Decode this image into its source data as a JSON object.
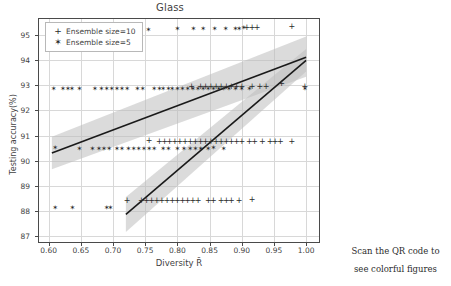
{
  "figure": {
    "title": "Glass",
    "xlabel": "Diversity R̄",
    "ylabel": "Testing accuracy(%)"
  },
  "legend": {
    "position": "upper-left",
    "entries": [
      {
        "marker": "+",
        "label": "Ensemble size=10"
      },
      {
        "marker": "✶",
        "label": "Ensemble size=5"
      }
    ]
  },
  "qr": {
    "caption_line1": "Scan the QR code to",
    "caption_line2": "see colorful figures",
    "icon": "qr-code-icon"
  },
  "colors": {
    "marker": "#2b2b2b",
    "regression_line": "#1a1a1a",
    "confidence_band": "#bdbdbd",
    "grid": "#d8d8d8",
    "axis": "#4a4a4a",
    "background": "#ffffff"
  },
  "chart_data": {
    "type": "scatter",
    "title": "Glass",
    "xlabel": "Diversity R̄",
    "ylabel": "Testing accuracy(%)",
    "xlim": [
      0.585,
      1.02
    ],
    "ylim": [
      86.75,
      95.65
    ],
    "xticks": [
      0.6,
      0.65,
      0.7,
      0.75,
      0.8,
      0.85,
      0.9,
      0.95,
      1.0
    ],
    "xticklabels": [
      "0.60",
      "0.65",
      "0.70",
      "0.75",
      "0.80",
      "0.85",
      "0.90",
      "0.95",
      "1.00"
    ],
    "yticks": [
      87,
      88,
      89,
      90,
      91,
      92,
      93,
      94,
      95
    ],
    "yticklabels": [
      "87",
      "88",
      "89",
      "90",
      "91",
      "92",
      "93",
      "94",
      "95"
    ],
    "grid": true,
    "legend_position": "upper left",
    "series": [
      {
        "name": "Ensemble size=5",
        "marker": "star",
        "points": [
          [
            0.61,
            95.25
          ],
          [
            0.655,
            95.25
          ],
          [
            0.755,
            95.22
          ],
          [
            0.8,
            95.25
          ],
          [
            0.825,
            95.25
          ],
          [
            0.84,
            95.25
          ],
          [
            0.858,
            95.25
          ],
          [
            0.875,
            95.25
          ],
          [
            0.89,
            95.25
          ],
          [
            0.896,
            95.25
          ],
          [
            0.903,
            95.28
          ],
          [
            0.608,
            92.87
          ],
          [
            0.622,
            92.87
          ],
          [
            0.63,
            92.87
          ],
          [
            0.636,
            92.87
          ],
          [
            0.648,
            92.87
          ],
          [
            0.672,
            92.87
          ],
          [
            0.682,
            92.87
          ],
          [
            0.69,
            92.87
          ],
          [
            0.698,
            92.87
          ],
          [
            0.706,
            92.87
          ],
          [
            0.714,
            92.87
          ],
          [
            0.722,
            92.87
          ],
          [
            0.738,
            92.87
          ],
          [
            0.746,
            92.87
          ],
          [
            0.764,
            92.87
          ],
          [
            0.772,
            92.87
          ],
          [
            0.778,
            92.87
          ],
          [
            0.786,
            92.87
          ],
          [
            0.792,
            92.87
          ],
          [
            0.8,
            92.87
          ],
          [
            0.808,
            92.87
          ],
          [
            0.816,
            92.87
          ],
          [
            0.824,
            92.87
          ],
          [
            0.832,
            92.87
          ],
          [
            0.84,
            92.87
          ],
          [
            0.848,
            92.87
          ],
          [
            0.856,
            92.87
          ],
          [
            0.864,
            92.87
          ],
          [
            0.872,
            92.87
          ],
          [
            0.88,
            92.87
          ],
          [
            0.89,
            92.87
          ],
          [
            0.9,
            92.87
          ],
          [
            0.912,
            92.87
          ],
          [
            0.998,
            92.87
          ],
          [
            0.61,
            90.5
          ],
          [
            0.648,
            90.48
          ],
          [
            0.668,
            90.46
          ],
          [
            0.678,
            90.46
          ],
          [
            0.686,
            90.46
          ],
          [
            0.694,
            90.46
          ],
          [
            0.706,
            90.46
          ],
          [
            0.714,
            90.46
          ],
          [
            0.724,
            90.46
          ],
          [
            0.732,
            90.46
          ],
          [
            0.74,
            90.46
          ],
          [
            0.748,
            90.46
          ],
          [
            0.756,
            90.46
          ],
          [
            0.764,
            90.46
          ],
          [
            0.778,
            90.46
          ],
          [
            0.786,
            90.46
          ],
          [
            0.8,
            90.46
          ],
          [
            0.81,
            90.46
          ],
          [
            0.82,
            90.46
          ],
          [
            0.828,
            90.46
          ],
          [
            0.836,
            90.46
          ],
          [
            0.848,
            90.46
          ],
          [
            0.856,
            90.52
          ],
          [
            0.872,
            90.46
          ],
          [
            0.61,
            88.1
          ],
          [
            0.637,
            88.1
          ],
          [
            0.69,
            88.12
          ],
          [
            0.696,
            88.12
          ]
        ]
      },
      {
        "name": "Ensemble size=10",
        "marker": "plus",
        "points": [
          [
            0.908,
            95.28
          ],
          [
            0.916,
            95.28
          ],
          [
            0.924,
            95.28
          ],
          [
            0.978,
            95.35
          ],
          [
            0.822,
            92.95
          ],
          [
            0.836,
            92.92
          ],
          [
            0.844,
            92.92
          ],
          [
            0.852,
            92.95
          ],
          [
            0.86,
            92.95
          ],
          [
            0.868,
            92.95
          ],
          [
            0.876,
            92.95
          ],
          [
            0.884,
            92.95
          ],
          [
            0.892,
            92.95
          ],
          [
            0.9,
            92.95
          ],
          [
            0.916,
            92.95
          ],
          [
            0.928,
            92.95
          ],
          [
            0.938,
            92.95
          ],
          [
            0.962,
            93.05
          ],
          [
            0.998,
            92.95
          ],
          [
            0.756,
            90.78
          ],
          [
            0.772,
            90.75
          ],
          [
            0.78,
            90.75
          ],
          [
            0.788,
            90.75
          ],
          [
            0.796,
            90.75
          ],
          [
            0.804,
            90.75
          ],
          [
            0.812,
            90.75
          ],
          [
            0.82,
            90.75
          ],
          [
            0.828,
            90.75
          ],
          [
            0.836,
            90.75
          ],
          [
            0.844,
            90.75
          ],
          [
            0.852,
            90.75
          ],
          [
            0.86,
            90.75
          ],
          [
            0.868,
            90.75
          ],
          [
            0.876,
            90.75
          ],
          [
            0.884,
            90.75
          ],
          [
            0.892,
            90.75
          ],
          [
            0.9,
            90.75
          ],
          [
            0.912,
            90.75
          ],
          [
            0.92,
            90.75
          ],
          [
            0.932,
            90.75
          ],
          [
            0.944,
            90.75
          ],
          [
            0.952,
            90.75
          ],
          [
            0.96,
            90.75
          ],
          [
            0.978,
            90.75
          ],
          [
            0.722,
            88.4
          ],
          [
            0.744,
            88.4
          ],
          [
            0.752,
            88.4
          ],
          [
            0.76,
            88.4
          ],
          [
            0.768,
            88.4
          ],
          [
            0.776,
            88.4
          ],
          [
            0.784,
            88.4
          ],
          [
            0.792,
            88.4
          ],
          [
            0.8,
            88.4
          ],
          [
            0.808,
            88.4
          ],
          [
            0.816,
            88.4
          ],
          [
            0.824,
            88.4
          ],
          [
            0.832,
            88.4
          ],
          [
            0.848,
            88.4
          ],
          [
            0.856,
            88.4
          ],
          [
            0.868,
            88.4
          ],
          [
            0.876,
            88.4
          ],
          [
            0.884,
            88.4
          ],
          [
            0.896,
            88.4
          ],
          [
            0.916,
            88.42
          ]
        ]
      }
    ],
    "regressions": [
      {
        "name": "Ensemble size=5 fit",
        "x": [
          0.605,
          1.0
        ],
        "y": [
          90.3,
          94.12
        ],
        "ci_lower": [
          89.65,
          93.35
        ],
        "ci_upper": [
          90.95,
          94.95
        ]
      },
      {
        "name": "Ensemble size=10 fit",
        "x": [
          0.72,
          1.0
        ],
        "y": [
          87.85,
          94.0
        ],
        "ci_lower": [
          87.15,
          93.55
        ],
        "ci_upper": [
          88.55,
          94.45
        ]
      }
    ]
  }
}
